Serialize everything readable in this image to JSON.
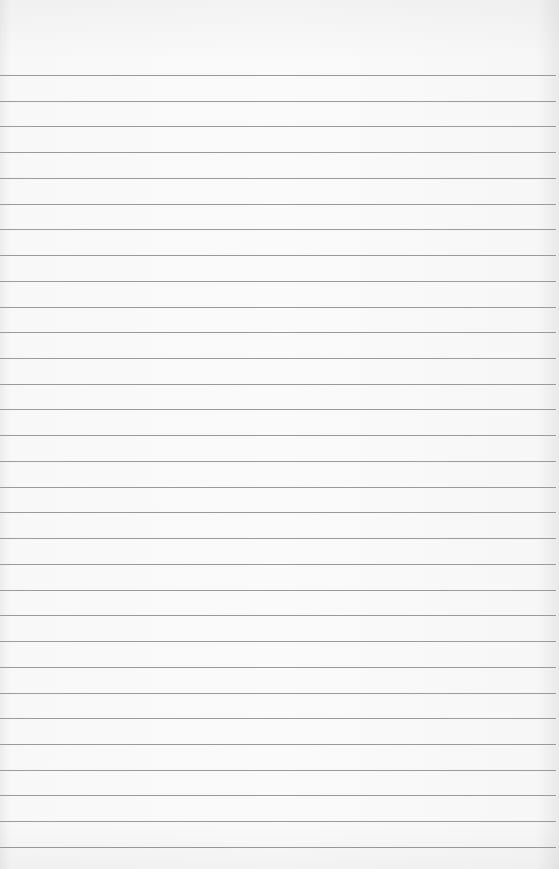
{
  "paper": {
    "type": "lined-notebook-paper",
    "line_color": "#9a9a9a",
    "background_color": "#f9f9f9",
    "first_line_y": 75,
    "line_spacing": 25.73,
    "line_count": 31
  }
}
